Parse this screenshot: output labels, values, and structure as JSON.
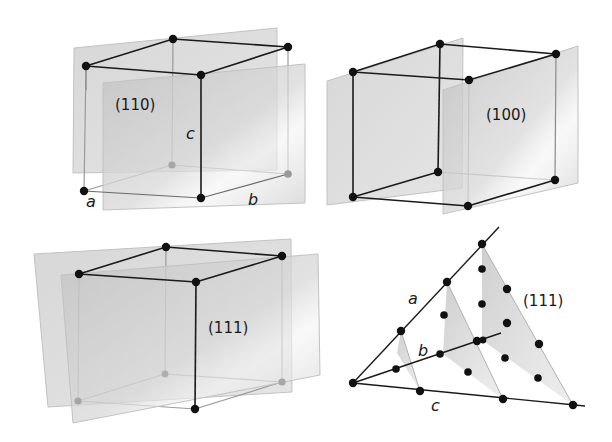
{
  "figure": {
    "panels": [
      {
        "id": "panel-110",
        "plane_label": "(110)",
        "axis_labels": {
          "a": "a",
          "b": "b",
          "c": "c"
        }
      },
      {
        "id": "panel-100",
        "plane_label": "(100)"
      },
      {
        "id": "panel-111-cube",
        "plane_label": "(111)"
      },
      {
        "id": "panel-111-stack",
        "plane_label": "(111)",
        "axis_labels": {
          "a": "a",
          "b": "b",
          "c": "c"
        }
      }
    ],
    "colors": {
      "plane_fill": "#c8c8c8",
      "plane_edge": "#b4b4b4",
      "edge_dark": "#1a1a1a",
      "edge_light": "#9a9a9a",
      "atom_dark": "#111111",
      "atom_hidden": "#9a9a9a"
    }
  }
}
